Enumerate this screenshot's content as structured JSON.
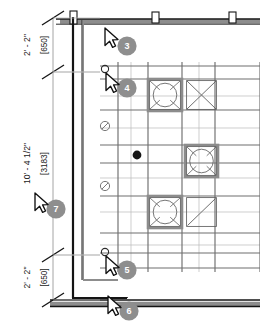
{
  "drawing": {
    "title": "Architectural floor plan detail",
    "type": "cad-floor-plan",
    "background_color": "#ffffff",
    "wall_color": "#141414",
    "grid_color": "#6e6e6e",
    "light_grid_color": "#b9b9b9",
    "tile_frame_color": "#8c8c8c",
    "dimension_color": "#1a1a1a",
    "badge_color": "#8e8e8e",
    "badge_text_color": "#ffffff",
    "cursor_fill": "#ffffff",
    "cursor_stroke": "#111111"
  },
  "dimensions": [
    {
      "id": "dim-top",
      "imperial": "2' - 2\"",
      "metric": "[650]",
      "y_top": 18,
      "y_bottom": 72
    },
    {
      "id": "dim-middle",
      "imperial": "10' - 4 1/2\"",
      "metric": "[3183]",
      "y_top": 72,
      "y_bottom": 255
    },
    {
      "id": "dim-bottom",
      "imperial": "2' - 2\"",
      "metric": "[650]",
      "y_top": 255,
      "y_bottom": 300
    }
  ],
  "markers": [
    {
      "id": "marker-3",
      "label": "3",
      "cx": 127,
      "cy": 46,
      "cursor_x": 105,
      "cursor_y": 28,
      "has_snap_circle": false
    },
    {
      "id": "marker-4",
      "label": "4",
      "cx": 127,
      "cy": 88,
      "cursor_x": 106,
      "cursor_y": 73,
      "has_snap_circle": true,
      "snap_x": 105,
      "snap_y": 69
    },
    {
      "id": "marker-7",
      "label": "7",
      "cx": 56,
      "cy": 209,
      "cursor_x": 35,
      "cursor_y": 193,
      "has_snap_circle": false
    },
    {
      "id": "marker-5",
      "label": "5",
      "cx": 127,
      "cy": 270,
      "cursor_x": 106,
      "cursor_y": 256,
      "has_snap_circle": true,
      "snap_x": 105,
      "snap_y": 252
    },
    {
      "id": "marker-6",
      "label": "6",
      "cx": 129,
      "cy": 311,
      "cursor_x": 108,
      "cursor_y": 296,
      "has_snap_circle": false
    }
  ],
  "symbols": {
    "blocked_markers": [
      {
        "id": "blocked-1",
        "cx": 105,
        "cy": 126,
        "r": 4.6
      },
      {
        "id": "blocked-2",
        "cx": 105,
        "cy": 186,
        "r": 4.6
      }
    ],
    "point_marker": {
      "id": "solid-point",
      "cx": 137,
      "cy": 155,
      "r": 4.4
    }
  },
  "grid": {
    "h_lines_major": [
      66,
      79,
      110,
      145,
      163,
      196,
      233,
      253,
      268
    ],
    "v_lines_major": [
      118,
      148,
      182,
      215,
      260
    ],
    "v_lines_light": [
      131,
      199
    ],
    "h_lines_light": [
      96,
      128,
      178,
      212,
      245
    ]
  },
  "tiles": [
    {
      "id": "tile-circle-1",
      "kind": "circle-in-square",
      "x": 148,
      "y": 79,
      "w": 34,
      "h": 32,
      "framed": true
    },
    {
      "id": "tile-cross-1",
      "kind": "x-in-square",
      "x": 185,
      "y": 79,
      "w": 33,
      "h": 32,
      "framed": false
    },
    {
      "id": "tile-circle-2",
      "kind": "circle-in-square",
      "x": 185,
      "y": 145,
      "w": 33,
      "h": 32,
      "framed": true
    },
    {
      "id": "tile-circle-3",
      "kind": "circle-in-square",
      "x": 148,
      "y": 196,
      "w": 34,
      "h": 32,
      "framed": true
    },
    {
      "id": "tile-diag-1",
      "kind": "diagonal-square",
      "x": 185,
      "y": 196,
      "w": 33,
      "h": 32,
      "framed": false
    }
  ],
  "walls": {
    "top_wall": {
      "y": 19,
      "x1": 60,
      "x2": 260,
      "thickness": 4
    },
    "bottom_wall": {
      "y": 300,
      "x1": 50,
      "x2": 260,
      "thickness": 4
    },
    "vertical_wall": {
      "x1": 73,
      "x2": 83,
      "y1": 17,
      "y2": 290
    },
    "posts": [
      {
        "id": "post-1",
        "x": 70,
        "y": 11,
        "w": 7,
        "h": 13
      },
      {
        "id": "post-2",
        "x": 152,
        "y": 12,
        "w": 7,
        "h": 11
      },
      {
        "id": "post-3",
        "x": 229,
        "y": 12,
        "w": 7,
        "h": 11
      }
    ]
  }
}
